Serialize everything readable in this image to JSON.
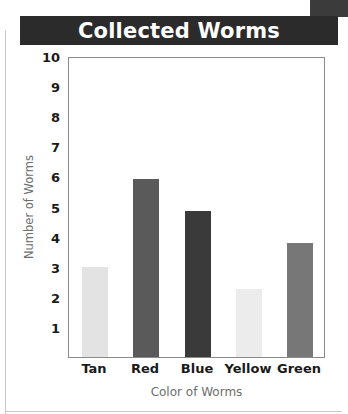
{
  "header": {
    "title": "Collected Worms"
  },
  "chart_data": {
    "type": "bar",
    "title": "Collected Worms",
    "xlabel": "Color of Worms",
    "ylabel": "Number of Worms",
    "categories": [
      "Tan",
      "Red",
      "Blue",
      "Yellow",
      "Green"
    ],
    "values": [
      3,
      5.9,
      4.85,
      2.25,
      3.8
    ],
    "bar_colors": [
      "#e3e3e3",
      "#5a5a5a",
      "#3a3a3a",
      "#ececec",
      "#777777"
    ],
    "ylim": [
      0,
      10
    ],
    "y_ticks": [
      10,
      9,
      8,
      7,
      6,
      5,
      4,
      3,
      2,
      1
    ],
    "grid": false,
    "legend": "none"
  },
  "colors": {
    "title_bar_background": "#2b2b2b",
    "title_text": "#ffffff",
    "axis_title_text": "#6e6e6e",
    "tick_text": "#1a1a1a",
    "plot_border": "#8a8a8a"
  }
}
